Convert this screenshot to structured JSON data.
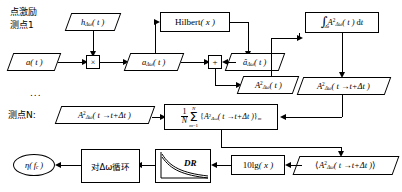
{
  "diagram": {
    "type": "flowchart",
    "labels": {
      "excitation_line1": "点激励",
      "excitation_line2": "测点1",
      "ellipsis": "...",
      "measure_point_n": "测点N:"
    },
    "nodes": {
      "a_t": "a(t)",
      "h_dw_t": "hΔω(t)",
      "multiply": "×",
      "a_dw_t": "aΔω(t)",
      "hilbert": "Hilbert( x )",
      "a_hat_dw_t": "âΔω(t)",
      "plus": "+",
      "A2_dw_t": "A²Δω(t)",
      "integral": "∫Δt A²Δω(t) dt",
      "A2_dw_shift": "A²Δω(t→t+Δt)",
      "A2_dw_shift_n": "A²Δω(t→t+Δt)",
      "average": "1/N Σ m=1..N {A²Δω(t→t+Δt)}m",
      "mean_bracket": "⟨A²Δω(t→t+Δt)⟩",
      "ten_lg": "10lg( x )",
      "dr": "DR",
      "loop_dw": "对Δω循环",
      "eta_fc": "η(fc)"
    },
    "colors": {
      "stroke": "#000000",
      "background": "#ffffff"
    }
  }
}
